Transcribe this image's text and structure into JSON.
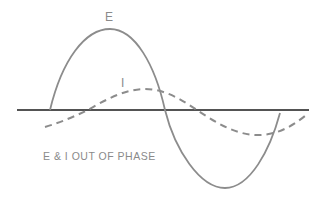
{
  "diagram": {
    "title": "E & I OUT OF PHASE",
    "labels": {
      "voltage": "E",
      "current": "I"
    },
    "caption": "E & I OUT OF PHASE",
    "colors": {
      "axis": "#1a1a1a",
      "voltage_wave": "#8c8c8c",
      "current_wave": "#8c8c8c",
      "text": "#8a8a8a"
    },
    "series": [
      {
        "name": "E",
        "style": "solid",
        "description": "voltage sine wave, large amplitude"
      },
      {
        "name": "I",
        "style": "dashed",
        "description": "current sine wave, smaller amplitude, leading/lagging phase"
      }
    ]
  }
}
